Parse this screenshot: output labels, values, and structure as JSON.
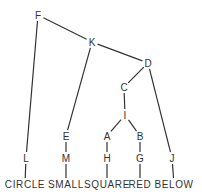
{
  "diagram": {
    "type": "tree",
    "nodes": [
      {
        "id": "F",
        "label": "F"
      },
      {
        "id": "K",
        "label": "K"
      },
      {
        "id": "D",
        "label": "D"
      },
      {
        "id": "C",
        "label": "C"
      },
      {
        "id": "I",
        "label": "I"
      },
      {
        "id": "A",
        "label": "A"
      },
      {
        "id": "B",
        "label": "B"
      },
      {
        "id": "E",
        "label": "E"
      },
      {
        "id": "M",
        "label": "M"
      },
      {
        "id": "L",
        "label": "L"
      },
      {
        "id": "H",
        "label": "H"
      },
      {
        "id": "G",
        "label": "G"
      },
      {
        "id": "J",
        "label": "J"
      },
      {
        "id": "CIRCLE",
        "label": "CIRCLE",
        "leaf": true
      },
      {
        "id": "SMALL",
        "label": "SMALL",
        "leaf": true
      },
      {
        "id": "SQUARE",
        "label": "SQUARE",
        "leaf": true
      },
      {
        "id": "RED",
        "label": "RED",
        "leaf": true
      },
      {
        "id": "BELOW",
        "label": "BELOW",
        "leaf": true
      }
    ],
    "edges": [
      [
        "F",
        "K"
      ],
      [
        "F",
        "L"
      ],
      [
        "K",
        "D"
      ],
      [
        "K",
        "E"
      ],
      [
        "D",
        "C"
      ],
      [
        "D",
        "J"
      ],
      [
        "C",
        "I"
      ],
      [
        "I",
        "A"
      ],
      [
        "I",
        "B"
      ],
      [
        "A",
        "H"
      ],
      [
        "B",
        "G"
      ],
      [
        "E",
        "M"
      ],
      [
        "L",
        "CIRCLE"
      ],
      [
        "M",
        "SMALL"
      ],
      [
        "H",
        "SQUARE"
      ],
      [
        "G",
        "RED"
      ],
      [
        "J",
        "BELOW"
      ]
    ]
  }
}
